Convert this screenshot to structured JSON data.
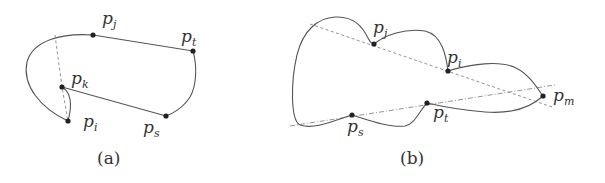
{
  "panels": [
    {
      "id": "a",
      "caption": "(a)",
      "points": {
        "pj": {
          "base": "p",
          "sub": "j"
        },
        "pt": {
          "base": "p",
          "sub": "t"
        },
        "pk": {
          "base": "p",
          "sub": "k"
        },
        "pi": {
          "base": "p",
          "sub": "i"
        },
        "ps": {
          "base": "p",
          "sub": "s"
        }
      }
    },
    {
      "id": "b",
      "caption": "(b)",
      "points": {
        "pj": {
          "base": "p",
          "sub": "j"
        },
        "pi": {
          "base": "p",
          "sub": "i"
        },
        "pm": {
          "base": "p",
          "sub": "m"
        },
        "pt": {
          "base": "p",
          "sub": "t"
        },
        "ps": {
          "base": "p",
          "sub": "s"
        }
      }
    }
  ],
  "colors": {
    "curve": "#555555",
    "dashed": "#888888",
    "point": "#222222",
    "text": "#333333"
  }
}
